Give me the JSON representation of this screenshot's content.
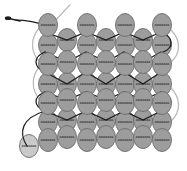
{
  "figure": {
    "background_color": "#ffffff",
    "width": 187,
    "height": 171
  },
  "palette": {
    "bead_fill": "#9d9d9d",
    "bead_fill_light": "#c9c9c9",
    "bead_outline": "#6b6b6b",
    "bead_hole_dash": "#2a2a2a",
    "thread_dark": "#1c1c1c",
    "thread_light": "#b9b9b9",
    "needle": "#1c1c1c"
  },
  "bead": {
    "shape": "ellipse",
    "rx": 9.5,
    "ry": 11.5,
    "count_total": 46,
    "rows": 7,
    "columns": 7
  },
  "labels": {
    "needle": "needle",
    "working_thread": "working thread",
    "tail_thread": "tail thread",
    "bead": "bead",
    "start_bead": "starting bead"
  },
  "beads": [
    {
      "cx": 48,
      "cy": 25,
      "fill": "#9d9d9d",
      "row": 0,
      "col": 0
    },
    {
      "cx": 87,
      "cy": 25,
      "fill": "#9d9d9d",
      "row": 0,
      "col": 1
    },
    {
      "cx": 125,
      "cy": 25,
      "fill": "#9d9d9d",
      "row": 0,
      "col": 2
    },
    {
      "cx": 162,
      "cy": 25,
      "fill": "#9d9d9d",
      "row": 0,
      "col": 3
    },
    {
      "cx": 48,
      "cy": 45,
      "fill": "#9d9d9d",
      "row": 1,
      "col": 0
    },
    {
      "cx": 67,
      "cy": 40,
      "fill": "#9d9d9d",
      "row": 1,
      "col": 1
    },
    {
      "cx": 87,
      "cy": 45,
      "fill": "#9d9d9d",
      "row": 1,
      "col": 2
    },
    {
      "cx": 106,
      "cy": 40,
      "fill": "#9d9d9d",
      "row": 1,
      "col": 3
    },
    {
      "cx": 125,
      "cy": 45,
      "fill": "#9d9d9d",
      "row": 1,
      "col": 4
    },
    {
      "cx": 143,
      "cy": 40,
      "fill": "#9d9d9d",
      "row": 1,
      "col": 5
    },
    {
      "cx": 162,
      "cy": 45,
      "fill": "#9d9d9d",
      "row": 1,
      "col": 6
    },
    {
      "cx": 48,
      "cy": 64,
      "fill": "#9d9d9d",
      "row": 2,
      "col": 0
    },
    {
      "cx": 67,
      "cy": 62,
      "fill": "#9d9d9d",
      "row": 2,
      "col": 1
    },
    {
      "cx": 87,
      "cy": 64,
      "fill": "#9d9d9d",
      "row": 2,
      "col": 2
    },
    {
      "cx": 106,
      "cy": 62,
      "fill": "#9d9d9d",
      "row": 2,
      "col": 3
    },
    {
      "cx": 125,
      "cy": 64,
      "fill": "#9d9d9d",
      "row": 2,
      "col": 4
    },
    {
      "cx": 143,
      "cy": 62,
      "fill": "#9d9d9d",
      "row": 2,
      "col": 5
    },
    {
      "cx": 162,
      "cy": 64,
      "fill": "#9d9d9d",
      "row": 2,
      "col": 6
    },
    {
      "cx": 48,
      "cy": 84,
      "fill": "#9d9d9d",
      "row": 3,
      "col": 0
    },
    {
      "cx": 67,
      "cy": 84,
      "fill": "#9d9d9d",
      "row": 3,
      "col": 1
    },
    {
      "cx": 87,
      "cy": 84,
      "fill": "#9d9d9d",
      "row": 3,
      "col": 2
    },
    {
      "cx": 106,
      "cy": 84,
      "fill": "#9d9d9d",
      "row": 3,
      "col": 3
    },
    {
      "cx": 125,
      "cy": 84,
      "fill": "#9d9d9d",
      "row": 3,
      "col": 4
    },
    {
      "cx": 143,
      "cy": 84,
      "fill": "#9d9d9d",
      "row": 3,
      "col": 5
    },
    {
      "cx": 162,
      "cy": 84,
      "fill": "#9d9d9d",
      "row": 3,
      "col": 6
    },
    {
      "cx": 48,
      "cy": 103,
      "fill": "#9d9d9d",
      "row": 4,
      "col": 0
    },
    {
      "cx": 67,
      "cy": 100,
      "fill": "#9d9d9d",
      "row": 4,
      "col": 1
    },
    {
      "cx": 87,
      "cy": 103,
      "fill": "#9d9d9d",
      "row": 4,
      "col": 2
    },
    {
      "cx": 106,
      "cy": 100,
      "fill": "#9d9d9d",
      "row": 4,
      "col": 3
    },
    {
      "cx": 125,
      "cy": 103,
      "fill": "#9d9d9d",
      "row": 4,
      "col": 4
    },
    {
      "cx": 143,
      "cy": 100,
      "fill": "#9d9d9d",
      "row": 4,
      "col": 5
    },
    {
      "cx": 162,
      "cy": 103,
      "fill": "#9d9d9d",
      "row": 4,
      "col": 6
    },
    {
      "cx": 48,
      "cy": 122,
      "fill": "#9d9d9d",
      "row": 5,
      "col": 0
    },
    {
      "cx": 67,
      "cy": 120,
      "fill": "#9d9d9d",
      "row": 5,
      "col": 1
    },
    {
      "cx": 87,
      "cy": 122,
      "fill": "#9d9d9d",
      "row": 5,
      "col": 2
    },
    {
      "cx": 106,
      "cy": 120,
      "fill": "#9d9d9d",
      "row": 5,
      "col": 3
    },
    {
      "cx": 125,
      "cy": 122,
      "fill": "#9d9d9d",
      "row": 5,
      "col": 4
    },
    {
      "cx": 143,
      "cy": 120,
      "fill": "#9d9d9d",
      "row": 5,
      "col": 5
    },
    {
      "cx": 162,
      "cy": 122,
      "fill": "#9d9d9d",
      "row": 5,
      "col": 6
    },
    {
      "cx": 48,
      "cy": 140,
      "fill": "#9d9d9d",
      "row": 6,
      "col": 0
    },
    {
      "cx": 67,
      "cy": 137,
      "fill": "#9d9d9d",
      "row": 6,
      "col": 1
    },
    {
      "cx": 87,
      "cy": 140,
      "fill": "#9d9d9d",
      "row": 6,
      "col": 2
    },
    {
      "cx": 106,
      "cy": 137,
      "fill": "#9d9d9d",
      "row": 6,
      "col": 3
    },
    {
      "cx": 125,
      "cy": 140,
      "fill": "#9d9d9d",
      "row": 6,
      "col": 4
    },
    {
      "cx": 143,
      "cy": 137,
      "fill": "#9d9d9d",
      "row": 6,
      "col": 5
    },
    {
      "cx": 162,
      "cy": 140,
      "fill": "#9d9d9d",
      "row": 6,
      "col": 6
    },
    {
      "cx": 29,
      "cy": 146,
      "fill": "#c9c9c9",
      "row": 7,
      "col": 0
    }
  ],
  "threads": [
    {
      "id": "tail-top",
      "color": "light",
      "d": "M 70,5 C 64,11 58,18 50,26"
    },
    {
      "id": "left-outer-loop",
      "color": "light",
      "d": "M 40,27 C 30,38 30,52 40,62"
    },
    {
      "id": "left-loop-2",
      "color": "light",
      "d": "M 40,66 C 31,76 31,90 40,100"
    },
    {
      "id": "right-outer-loop-1",
      "color": "light",
      "d": "M 171,30 C 181,40 181,53 171,62"
    },
    {
      "id": "right-outer-loop-2",
      "color": "light",
      "d": "M 171,88 C 181,98 181,112 171,121"
    },
    {
      "id": "row0-row1-zig",
      "color": "dark",
      "d": "M 45,32 L 67,40 L 86,32 L 106,40 L 124,32 L 143,40 L 161,32"
    },
    {
      "id": "row1-row2-zig",
      "color": "dark",
      "d": "M 45,52 L 67,62 L 86,52 L 106,62 L 124,52 L 143,62 L 161,52"
    },
    {
      "id": "row2-row3-zig",
      "color": "dark",
      "d": "M 45,72 L 67,84 L 86,72 L 106,84 L 124,72 L 143,84 L 161,72"
    },
    {
      "id": "row3-row4-zig",
      "color": "dark",
      "d": "M 45,92 L 67,100 L 86,92 L 106,100 L 124,92 L 143,100 L 161,92"
    },
    {
      "id": "row4-row5-zig",
      "color": "dark",
      "d": "M 45,111 L 67,120 L 86,111 L 106,120 L 124,111 L 143,120 L 161,111"
    },
    {
      "id": "right-turn-dark-1",
      "color": "dark",
      "d": "M 161,32 C 174,37 174,48 163,52"
    },
    {
      "id": "right-turn-dark-2",
      "color": "dark",
      "d": "M 161,92 C 174,97 174,107 163,111"
    },
    {
      "id": "left-turn-dark-1",
      "color": "dark",
      "d": "M 45,52 C 33,57 33,67 45,72"
    },
    {
      "id": "left-turn-dark-2",
      "color": "dark",
      "d": "M 45,92 C 33,97 33,106 45,111"
    },
    {
      "id": "start-tail-curve",
      "color": "dark",
      "d": "M 45,111 C 22,118 18,132 27,146"
    },
    {
      "id": "needle-thread",
      "color": "dark",
      "d": "M 16,20 C 26,20 36,22 44,25"
    }
  ],
  "needle": {
    "shaft_d": "M 7,18 L 20,21",
    "eye_cx": 8,
    "eye_cy": 18.2,
    "eye_rx": 3.2,
    "eye_ry": 1.9
  }
}
